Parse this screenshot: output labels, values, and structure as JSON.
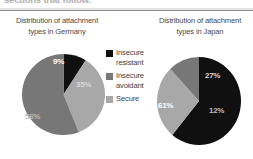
{
  "page": {
    "running_text_cutoff": "sections that follow."
  },
  "legend": {
    "items": [
      {
        "label": "Insecure\nresistant",
        "color": "#101010",
        "key": "insecure_resistant"
      },
      {
        "label": "Insecure\navoidant",
        "color": "#777777",
        "key": "insecure_avoidant"
      },
      {
        "label": "Secure",
        "color": "#a8a8a8",
        "key": "secure"
      }
    ]
  },
  "chart_data": [
    {
      "type": "pie",
      "id": "germany",
      "title": "Distribution of attachment\ntypes in Germany",
      "categories": [
        "Insecure resistant",
        "Insecure avoidant",
        "Secure"
      ],
      "values": [
        9,
        56,
        35
      ],
      "labels": [
        "9%",
        "56%",
        "35%"
      ],
      "colors": [
        "#101010",
        "#777777",
        "#a8a8a8"
      ],
      "unit": "%",
      "legend_position": "center-shared"
    },
    {
      "type": "pie",
      "id": "japan",
      "title": "Distribution of attachment\ntypes in Japan",
      "categories": [
        "Insecure resistant",
        "Insecure avoidant",
        "Secure"
      ],
      "values": [
        61,
        12,
        27
      ],
      "labels": [
        "61%",
        "12%",
        "27%"
      ],
      "colors": [
        "#101010",
        "#777777",
        "#a8a8a8"
      ],
      "unit": "%",
      "legend_position": "center-shared"
    }
  ]
}
